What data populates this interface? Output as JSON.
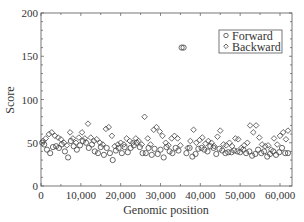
{
  "chart_data": {
    "type": "scatter",
    "title": "",
    "xlabel": "Genomic position",
    "ylabel": "Score",
    "xlim": [
      0,
      63000
    ],
    "ylim": [
      0,
      200
    ],
    "xticks": [
      0,
      10000,
      20000,
      30000,
      40000,
      50000,
      60000
    ],
    "xtick_labels": [
      "0",
      "10,000",
      "20,000",
      "30,000",
      "40,000",
      "50,000",
      "60,000"
    ],
    "yticks": [
      0,
      50,
      100,
      150,
      200
    ],
    "ytick_labels": [
      "0",
      "50",
      "100",
      "150",
      "200"
    ],
    "grid": false,
    "legend_position": "upper right",
    "series": [
      {
        "name": "Forward",
        "marker": "circle",
        "points": [
          [
            300,
            50
          ],
          [
            800,
            48
          ],
          [
            1500,
            42
          ],
          [
            2300,
            38
          ],
          [
            3000,
            45
          ],
          [
            3800,
            46
          ],
          [
            4500,
            44
          ],
          [
            5200,
            48
          ],
          [
            6000,
            40
          ],
          [
            6800,
            33
          ],
          [
            7500,
            52
          ],
          [
            8200,
            46
          ],
          [
            9000,
            42
          ],
          [
            9800,
            47
          ],
          [
            10500,
            52
          ],
          [
            11300,
            50
          ],
          [
            12000,
            44
          ],
          [
            12800,
            48
          ],
          [
            13500,
            40
          ],
          [
            14300,
            38
          ],
          [
            15000,
            45
          ],
          [
            15800,
            36
          ],
          [
            16500,
            44
          ],
          [
            17300,
            38
          ],
          [
            18000,
            30
          ],
          [
            18800,
            41
          ],
          [
            19500,
            44
          ],
          [
            20300,
            38
          ],
          [
            21000,
            45
          ],
          [
            21800,
            39
          ],
          [
            22500,
            44
          ],
          [
            23300,
            47
          ],
          [
            24000,
            50
          ],
          [
            24800,
            45
          ],
          [
            25500,
            38
          ],
          [
            26300,
            38
          ],
          [
            27000,
            44
          ],
          [
            27800,
            36
          ],
          [
            28500,
            43
          ],
          [
            29300,
            37
          ],
          [
            30000,
            42
          ],
          [
            30800,
            33
          ],
          [
            31500,
            45
          ],
          [
            32300,
            40
          ],
          [
            33000,
            38
          ],
          [
            33800,
            44
          ],
          [
            34500,
            41
          ],
          [
            35300,
            160
          ],
          [
            35800,
            160
          ],
          [
            36500,
            38
          ],
          [
            37300,
            44
          ],
          [
            38000,
            34
          ],
          [
            38800,
            37
          ],
          [
            39500,
            43
          ],
          [
            40300,
            44
          ],
          [
            41000,
            42
          ],
          [
            41800,
            40
          ],
          [
            42500,
            46
          ],
          [
            43300,
            44
          ],
          [
            44000,
            37
          ],
          [
            44800,
            43
          ],
          [
            45500,
            41
          ],
          [
            46300,
            38
          ],
          [
            47000,
            39
          ],
          [
            47800,
            39
          ],
          [
            48500,
            41
          ],
          [
            49300,
            40
          ],
          [
            50000,
            39
          ],
          [
            50800,
            42
          ],
          [
            51500,
            38
          ],
          [
            52300,
            40
          ],
          [
            53000,
            35
          ],
          [
            53800,
            37
          ],
          [
            54500,
            42
          ],
          [
            55300,
            38
          ],
          [
            56000,
            40
          ],
          [
            56800,
            34
          ],
          [
            57500,
            37
          ],
          [
            58300,
            40
          ],
          [
            59000,
            36
          ],
          [
            59800,
            39
          ],
          [
            60500,
            44
          ],
          [
            61300,
            38
          ],
          [
            62000,
            38
          ]
        ]
      },
      {
        "name": "Backward",
        "marker": "diamond",
        "points": [
          [
            500,
            52
          ],
          [
            1200,
            55
          ],
          [
            2000,
            60
          ],
          [
            2700,
            62
          ],
          [
            3500,
            58
          ],
          [
            4300,
            56
          ],
          [
            5000,
            54
          ],
          [
            5800,
            50
          ],
          [
            6500,
            47
          ],
          [
            7300,
            62
          ],
          [
            8000,
            55
          ],
          [
            8800,
            50
          ],
          [
            9500,
            56
          ],
          [
            10300,
            62
          ],
          [
            11000,
            55
          ],
          [
            11800,
            72
          ],
          [
            12500,
            56
          ],
          [
            13300,
            52
          ],
          [
            14000,
            54
          ],
          [
            14800,
            50
          ],
          [
            15500,
            48
          ],
          [
            16300,
            66
          ],
          [
            17000,
            68
          ],
          [
            17800,
            58
          ],
          [
            18500,
            46
          ],
          [
            19300,
            48
          ],
          [
            20000,
            50
          ],
          [
            20800,
            48
          ],
          [
            21500,
            55
          ],
          [
            22300,
            52
          ],
          [
            23000,
            50
          ],
          [
            23800,
            55
          ],
          [
            24500,
            52
          ],
          [
            25300,
            48
          ],
          [
            26000,
            80
          ],
          [
            26800,
            55
          ],
          [
            27500,
            48
          ],
          [
            28300,
            65
          ],
          [
            29000,
            68
          ],
          [
            29800,
            63
          ],
          [
            30500,
            58
          ],
          [
            31300,
            50
          ],
          [
            32000,
            47
          ],
          [
            32800,
            55
          ],
          [
            33500,
            58
          ],
          [
            34300,
            55
          ],
          [
            35000,
            47
          ],
          [
            36800,
            44
          ],
          [
            37500,
            52
          ],
          [
            38300,
            65
          ],
          [
            39000,
            50
          ],
          [
            39800,
            53
          ],
          [
            40500,
            56
          ],
          [
            41300,
            49
          ],
          [
            42000,
            52
          ],
          [
            42800,
            50
          ],
          [
            43500,
            46
          ],
          [
            44300,
            57
          ],
          [
            45000,
            64
          ],
          [
            45800,
            48
          ],
          [
            46500,
            47
          ],
          [
            47300,
            50
          ],
          [
            48000,
            46
          ],
          [
            48800,
            55
          ],
          [
            49500,
            54
          ],
          [
            50300,
            44
          ],
          [
            51000,
            47
          ],
          [
            51800,
            50
          ],
          [
            52500,
            70
          ],
          [
            53300,
            62
          ],
          [
            54000,
            70
          ],
          [
            54800,
            56
          ],
          [
            55500,
            48
          ],
          [
            56300,
            46
          ],
          [
            57000,
            47
          ],
          [
            57800,
            42
          ],
          [
            58500,
            55
          ],
          [
            59300,
            48
          ],
          [
            60000,
            58
          ],
          [
            60800,
            62
          ],
          [
            61500,
            54
          ],
          [
            62000,
            64
          ]
        ]
      }
    ]
  },
  "legend": {
    "forward_label": "Forward",
    "backward_label": "Backward"
  },
  "axes": {
    "xlabel": "Genomic position",
    "ylabel": "Score"
  }
}
